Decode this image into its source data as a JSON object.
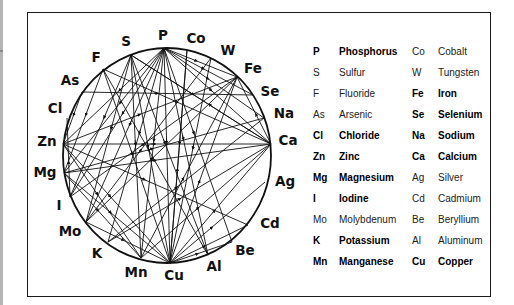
{
  "diagram": {
    "title": "",
    "nodes": [
      {
        "symbol": "P",
        "x": 164,
        "y": 48,
        "lx": 163,
        "ly": 40
      },
      {
        "symbol": "Co",
        "x": 187,
        "y": 50,
        "lx": 196,
        "ly": 43
      },
      {
        "symbol": "W",
        "x": 211,
        "y": 58,
        "lx": 228,
        "ly": 55
      },
      {
        "symbol": "Fe",
        "x": 237,
        "y": 77,
        "lx": 253,
        "ly": 73
      },
      {
        "symbol": "Se",
        "x": 253,
        "y": 95,
        "lx": 270,
        "ly": 96
      },
      {
        "symbol": "Na",
        "x": 264,
        "y": 118,
        "lx": 284,
        "ly": 118
      },
      {
        "symbol": "Ca",
        "x": 271,
        "y": 144,
        "lx": 288,
        "ly": 145
      },
      {
        "symbol": "Ag",
        "x": 265,
        "y": 182,
        "lx": 285,
        "ly": 186
      },
      {
        "symbol": "Cd",
        "x": 248,
        "y": 225,
        "lx": 270,
        "ly": 228
      },
      {
        "symbol": "Be",
        "x": 232,
        "y": 242,
        "lx": 245,
        "ly": 255
      },
      {
        "symbol": "Al",
        "x": 208,
        "y": 255,
        "lx": 214,
        "ly": 271
      },
      {
        "symbol": "Cu",
        "x": 170,
        "y": 263,
        "lx": 174,
        "ly": 280
      },
      {
        "symbol": "Mn",
        "x": 141,
        "y": 258,
        "lx": 136,
        "ly": 277
      },
      {
        "symbol": "K",
        "x": 108,
        "y": 242,
        "lx": 97,
        "ly": 258
      },
      {
        "symbol": "Mo",
        "x": 86,
        "y": 222,
        "lx": 70,
        "ly": 236
      },
      {
        "symbol": "I",
        "x": 70,
        "y": 197,
        "lx": 59,
        "ly": 210
      },
      {
        "symbol": "Mg",
        "x": 64,
        "y": 173,
        "lx": 45,
        "ly": 177
      },
      {
        "symbol": "Zn",
        "x": 63,
        "y": 144,
        "lx": 47,
        "ly": 146
      },
      {
        "symbol": "Cl",
        "x": 67,
        "y": 118,
        "lx": 55,
        "ly": 113
      },
      {
        "symbol": "As",
        "x": 82,
        "y": 92,
        "lx": 70,
        "ly": 85
      },
      {
        "symbol": "F",
        "x": 103,
        "y": 69,
        "lx": 96,
        "ly": 62
      },
      {
        "symbol": "S",
        "x": 131,
        "y": 55,
        "lx": 126,
        "ly": 46
      }
    ],
    "connections": [
      [
        "P",
        "Fe"
      ],
      [
        "P",
        "Se"
      ],
      [
        "P",
        "Na"
      ],
      [
        "P",
        "Ca"
      ],
      [
        "P",
        "Cu"
      ],
      [
        "P",
        "Mn"
      ],
      [
        "P",
        "Al"
      ],
      [
        "P",
        "Be"
      ],
      [
        "P",
        "Mg"
      ],
      [
        "P",
        "Zn"
      ],
      [
        "P",
        "Mo"
      ],
      [
        "P",
        "K"
      ],
      [
        "P",
        "I"
      ],
      [
        "S",
        "Ca"
      ],
      [
        "S",
        "Cu"
      ],
      [
        "S",
        "Al"
      ],
      [
        "S",
        "Mo"
      ],
      [
        "S",
        "I"
      ],
      [
        "S",
        "Mn"
      ],
      [
        "F",
        "Ca"
      ],
      [
        "F",
        "Cu"
      ],
      [
        "F",
        "Mg"
      ],
      [
        "F",
        "Al"
      ],
      [
        "As",
        "Se"
      ],
      [
        "As",
        "Zn"
      ],
      [
        "Zn",
        "Ca"
      ],
      [
        "Zn",
        "Fe"
      ],
      [
        "Zn",
        "Cu"
      ],
      [
        "Zn",
        "Cd"
      ],
      [
        "Zn",
        "Mn"
      ],
      [
        "Mg",
        "Ca"
      ],
      [
        "Mg",
        "Na"
      ],
      [
        "Mg",
        "Cu"
      ],
      [
        "Mg",
        "Mn"
      ],
      [
        "I",
        "Fe"
      ],
      [
        "I",
        "Cl"
      ],
      [
        "Mo",
        "Cu"
      ],
      [
        "Mo",
        "W"
      ],
      [
        "Mo",
        "Fe"
      ],
      [
        "K",
        "Na"
      ],
      [
        "K",
        "Ca"
      ],
      [
        "Mn",
        "Fe"
      ],
      [
        "Mn",
        "Ca"
      ],
      [
        "Cu",
        "Ca"
      ],
      [
        "Cu",
        "Ag"
      ],
      [
        "Cu",
        "Cd"
      ],
      [
        "Cu",
        "Fe"
      ],
      [
        "Cu",
        "Be"
      ],
      [
        "Cu",
        "Co"
      ],
      [
        "Ca",
        "Fe"
      ],
      [
        "Ca",
        "S"
      ],
      [
        "Co",
        "Cu"
      ],
      [
        "W",
        "Cu"
      ]
    ]
  },
  "legend": {
    "rows": [
      {
        "sym1": "P",
        "name1": "Phosphorus",
        "bold1": true,
        "sym2": "Co",
        "name2": "Cobalt",
        "bold2": false
      },
      {
        "sym1": "S",
        "name1": "Sulfur",
        "bold1": false,
        "sym2": "W",
        "name2": "Tungsten",
        "bold2": false
      },
      {
        "sym1": "F",
        "name1": "Fluoride",
        "bold1": false,
        "sym2": "Fe",
        "name2": "Iron",
        "bold2": true
      },
      {
        "sym1": "As",
        "name1": "Arsenic",
        "bold1": false,
        "sym2": "Se",
        "name2": "Selenium",
        "bold2": true
      },
      {
        "sym1": "Cl",
        "name1": "Chloride",
        "bold1": true,
        "sym2": "Na",
        "name2": "Sodium",
        "bold2": true
      },
      {
        "sym1": "Zn",
        "name1": "Zinc",
        "bold1": true,
        "sym2": "Ca",
        "name2": "Calcium",
        "bold2": true
      },
      {
        "sym1": "Mg",
        "name1": "Magnesium",
        "bold1": true,
        "sym2": "Ag",
        "name2": "Silver",
        "bold2": false
      },
      {
        "sym1": "I",
        "name1": "Iodine",
        "bold1": true,
        "sym2": "Cd",
        "name2": "Cadmium",
        "bold2": false
      },
      {
        "sym1": "Mo",
        "name1": "Molybdenum",
        "bold1": false,
        "sym2": "Be",
        "name2": "Beryllium",
        "bold2": false
      },
      {
        "sym1": "K",
        "name1": "Potassium",
        "bold1": true,
        "sym2": "Al",
        "name2": "Aluminum",
        "bold2": false
      },
      {
        "sym1": "Mn",
        "name1": "Manganese",
        "bold1": true,
        "sym2": "Cu",
        "name2": "Copper",
        "bold2": true
      }
    ]
  },
  "colors": {
    "line": "#111111",
    "frame": "#1a1a1a",
    "strip": "#b5b5b5",
    "text": "#111111"
  }
}
